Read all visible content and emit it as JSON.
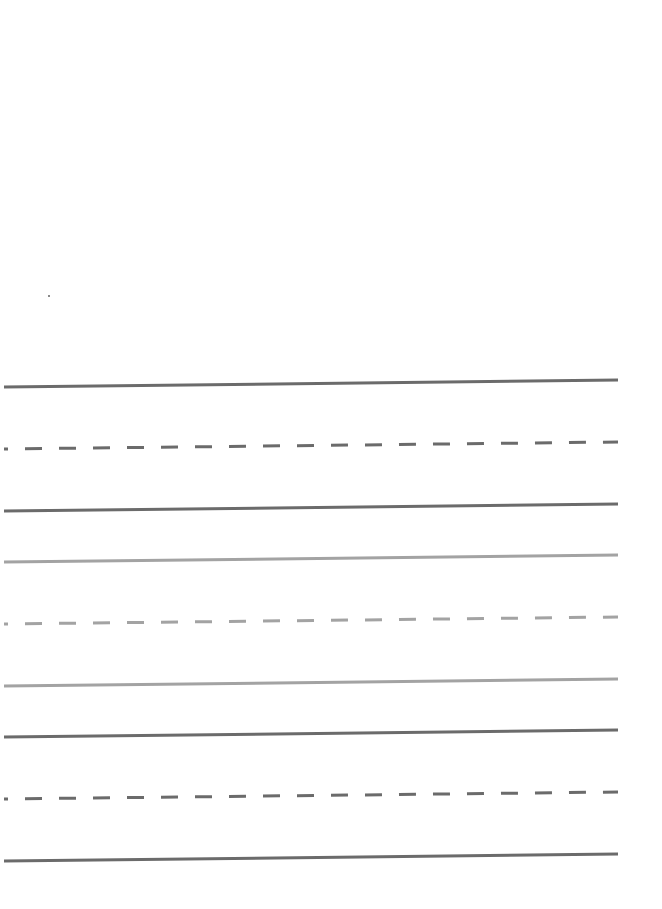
{
  "document": {
    "type": "handwriting-practice-sheet",
    "background": "#ffffff",
    "line_groups": [
      {
        "color_dark": "#6b6b6b",
        "lines": [
          {
            "role": "top-line",
            "style": "solid",
            "y_left": 387,
            "y_right": 380,
            "color": "#6b6b6b"
          },
          {
            "role": "mid-line",
            "style": "dashed",
            "y_left": 449,
            "y_right": 442,
            "color": "#6b6b6b"
          },
          {
            "role": "base-line",
            "style": "solid",
            "y_left": 511,
            "y_right": 504,
            "color": "#6b6b6b"
          }
        ]
      },
      {
        "lines": [
          {
            "role": "top-line",
            "style": "solid",
            "y_left": 562,
            "y_right": 555,
            "color": "#a3a3a3"
          },
          {
            "role": "mid-line",
            "style": "dashed",
            "y_left": 624,
            "y_right": 617,
            "color": "#a3a3a3"
          },
          {
            "role": "base-line",
            "style": "solid",
            "y_left": 686,
            "y_right": 679,
            "color": "#a3a3a3"
          }
        ]
      },
      {
        "lines": [
          {
            "role": "top-line",
            "style": "solid",
            "y_left": 737,
            "y_right": 730,
            "color": "#6b6b6b"
          },
          {
            "role": "mid-line",
            "style": "dashed",
            "y_left": 799,
            "y_right": 792,
            "color": "#6b6b6b"
          },
          {
            "role": "base-line",
            "style": "solid",
            "y_left": 861,
            "y_right": 854,
            "color": "#6b6b6b"
          }
        ]
      }
    ],
    "x_start": 4,
    "x_end": 618
  }
}
